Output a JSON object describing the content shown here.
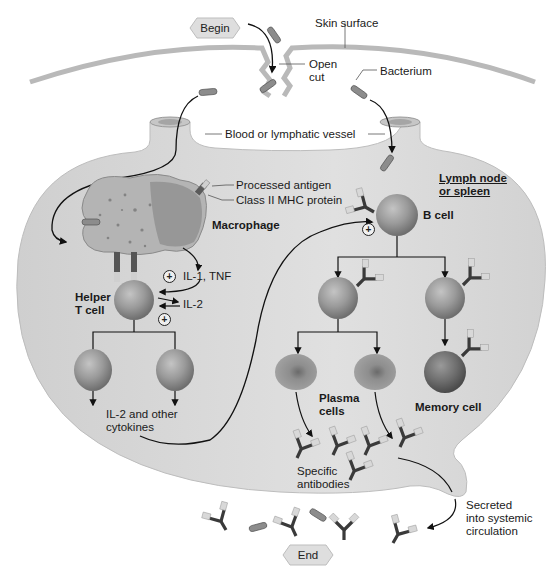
{
  "flow": {
    "begin_label": "Begin",
    "end_label": "End"
  },
  "labels": {
    "skin_surface": "Skin surface",
    "open_cut_line1": "Open",
    "open_cut_line2": "cut",
    "bacterium": "Bacterium",
    "vessel": "Blood or lymphatic vessel",
    "processed_antigen": "Processed antigen",
    "mhc_protein": "Class II MHC protein",
    "macrophage": "Macrophage",
    "il1_tnf": "IL-1, TNF",
    "il2": "IL-2",
    "helper_line1": "Helper",
    "helper_line2": "T cell",
    "lymph_line1": "Lymph node",
    "lymph_line2": "or spleen",
    "b_cell": "B cell",
    "plasma_line1": "Plasma",
    "plasma_line2": "cells",
    "memory_cell": "Memory cell",
    "il2_other_line1": "IL-2 and other",
    "il2_other_line2": "cytokines",
    "antibodies_line1": "Specific",
    "antibodies_line2": "antibodies",
    "secreted_line1": "Secreted",
    "secreted_line2": "into systemic",
    "secreted_line3": "circulation",
    "plus_sign": "+"
  },
  "colors": {
    "tissue": "#d4d4d4",
    "skin": "#b9b9b9",
    "cell": "#a9a9a9",
    "cell_dark": "#7a7a7a",
    "antibody": "#3a3a3a",
    "antigen_tip": "#d8d8d8",
    "bacterium": "#8c8c8c",
    "arrow": "#111111",
    "hex": "#dedede"
  },
  "icons": {
    "stimulation": "plus-in-circle-icon",
    "flow_start": "hexagon-begin-icon",
    "flow_end": "hexagon-end-icon"
  }
}
